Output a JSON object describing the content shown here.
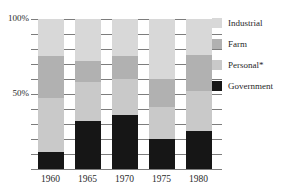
{
  "chart_data": {
    "type": "bar",
    "variant": "stacked-100-percent",
    "title": "",
    "categories": [
      "1960",
      "1965",
      "1970",
      "1975",
      "1980"
    ],
    "series": [
      {
        "name": "Industrial",
        "color": "#d8d8d8",
        "values": [
          25,
          28,
          25,
          40,
          24
        ]
      },
      {
        "name": "Farm",
        "color": "#b1b1b1",
        "values": [
          28,
          14,
          15,
          19,
          24
        ]
      },
      {
        "name": "Personal*",
        "color": "#c9c9c9",
        "values": [
          36,
          26,
          24,
          21,
          27
        ]
      },
      {
        "name": "Government",
        "color": "#161616",
        "values": [
          11,
          32,
          36,
          20,
          25
        ]
      }
    ],
    "unit": "%",
    "ylim": [
      0,
      100
    ],
    "y_axis_labels": [
      {
        "value": 100,
        "label": "100%"
      },
      {
        "value": 50,
        "label": "50%"
      }
    ],
    "gridlines": {
      "orientation": "horizontal",
      "interval": 10
    },
    "legend": {
      "position": "right"
    }
  },
  "colors": {
    "background": "#ffffff",
    "gridline": "#7d7d7d",
    "text": "#2b2b2b"
  }
}
